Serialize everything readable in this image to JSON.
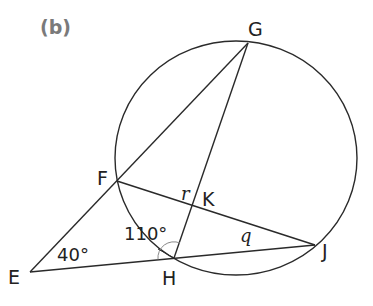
{
  "figure": {
    "part_label": "(b)",
    "points": {
      "E": {
        "label": "E",
        "x": 30,
        "y": 272
      },
      "F": {
        "label": "F",
        "x": 117,
        "y": 181
      },
      "G": {
        "label": "G",
        "x": 248,
        "y": 43
      },
      "H": {
        "label": "H",
        "x": 174,
        "y": 258
      },
      "J": {
        "label": "J",
        "x": 315,
        "y": 245
      },
      "K": {
        "label": "K",
        "x": 191,
        "y": 207
      }
    },
    "circle": {
      "cx": 236,
      "cy": 158,
      "r": 119,
      "passes_through": [
        "F",
        "G",
        "H",
        "J"
      ]
    },
    "segments": [
      "E-G",
      "E-J",
      "F-J",
      "G-H"
    ],
    "angles": {
      "E": {
        "label": "40°"
      },
      "FHE": {
        "label": "110°"
      },
      "r": {
        "label": "r",
        "at": "K"
      },
      "q": {
        "label": "q",
        "at": "J"
      }
    },
    "colors": {
      "line": "#2a2a2a",
      "part_label": "#7a7a7a",
      "text": "#222222"
    }
  }
}
